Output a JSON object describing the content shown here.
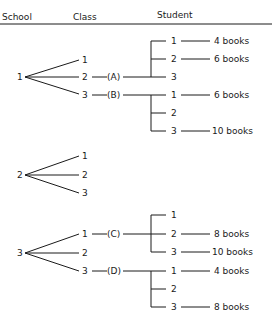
{
  "header": {
    "school": "School",
    "class": "Class",
    "student": "Student"
  },
  "schools": [
    {
      "label": "1",
      "classes": [
        {
          "label": "1"
        },
        {
          "label": "2",
          "group": "(A)",
          "students": [
            {
              "label": "1",
              "books": "4 books"
            },
            {
              "label": "2",
              "books": "6 books"
            },
            {
              "label": "3",
              "books": ""
            }
          ]
        },
        {
          "label": "3",
          "group": "(B)",
          "students": [
            {
              "label": "1",
              "books": "6 books"
            },
            {
              "label": "2",
              "books": ""
            },
            {
              "label": "3",
              "books": "10 books"
            }
          ]
        }
      ]
    },
    {
      "label": "2",
      "classes": [
        {
          "label": "1"
        },
        {
          "label": "2"
        },
        {
          "label": "3"
        }
      ]
    },
    {
      "label": "3",
      "classes": [
        {
          "label": "1",
          "group": "(C)",
          "students": [
            {
              "label": "1",
              "books": ""
            },
            {
              "label": "2",
              "books": "8 books"
            },
            {
              "label": "3",
              "books": "10 books"
            }
          ]
        },
        {
          "label": "2"
        },
        {
          "label": "3",
          "group": "(D)",
          "students": [
            {
              "label": "1",
              "books": "4 books"
            },
            {
              "label": "2",
              "books": ""
            },
            {
              "label": "3",
              "books": "8 books"
            }
          ]
        }
      ]
    }
  ]
}
